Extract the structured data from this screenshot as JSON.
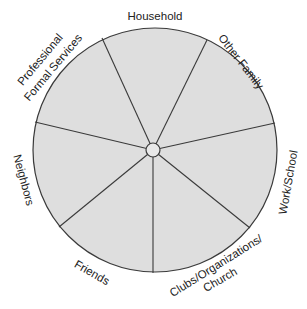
{
  "diagram": {
    "type": "segmented-wheel",
    "colors": {
      "fill": "#dedede",
      "stroke": "#3a3a3a",
      "background": "#ffffff",
      "text": "#222222"
    },
    "segments": [
      {
        "label": "Household"
      },
      {
        "label": "Other Family"
      },
      {
        "label": "Work/School"
      },
      {
        "label": "Clubs/Organizations/",
        "label2": "Church"
      },
      {
        "label": "Friends"
      },
      {
        "label": "Neighbors"
      },
      {
        "label": "Professional",
        "label2": "Formal Services"
      }
    ]
  }
}
